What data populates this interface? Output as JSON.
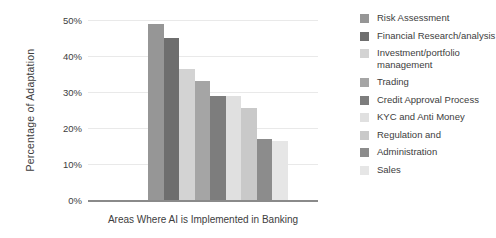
{
  "chart_data": {
    "type": "bar",
    "title": "",
    "xlabel": "Areas Where AI is Implemented in Banking",
    "ylabel": "Percentage of Adaptation",
    "ylim": [
      0,
      50
    ],
    "grid": true,
    "legend_position": "right",
    "yticks": [
      "0%",
      "10%",
      "20%",
      "30%",
      "40%",
      "50%"
    ],
    "ytick_values": [
      0,
      10,
      20,
      30,
      40,
      50
    ],
    "categories": [
      "Risk Assessment",
      "Financial Research/analysis",
      "Investment/portfolio management",
      "Trading",
      "Credit Approval Process",
      "KYC and Anti Money",
      "Regulation and",
      "Administration",
      "Sales"
    ],
    "values": [
      49,
      45,
      36.5,
      33,
      29,
      29,
      25.5,
      17,
      16.5
    ],
    "colors": [
      "#969696",
      "#6e6e6e",
      "#d3d3d3",
      "#a5a5a5",
      "#7d7d7d",
      "#e0e0e0",
      "#c9c9c9",
      "#8c8c8c",
      "#e6e6e6"
    ]
  },
  "legend": {
    "items": [
      {
        "label": "Risk Assessment",
        "color": "#969696"
      },
      {
        "label": "Financial Research/analysis",
        "color": "#6e6e6e"
      },
      {
        "label": "Investment/portfolio management",
        "color": "#d3d3d3"
      },
      {
        "label": "Trading",
        "color": "#a5a5a5"
      },
      {
        "label": "Credit Approval Process",
        "color": "#7d7d7d"
      },
      {
        "label": "KYC and Anti Money",
        "color": "#e0e0e0"
      },
      {
        "label": "Regulation and",
        "color": "#c9c9c9"
      },
      {
        "label": "Administration",
        "color": "#8c8c8c"
      },
      {
        "label": "Sales",
        "color": "#e6e6e6"
      }
    ]
  }
}
